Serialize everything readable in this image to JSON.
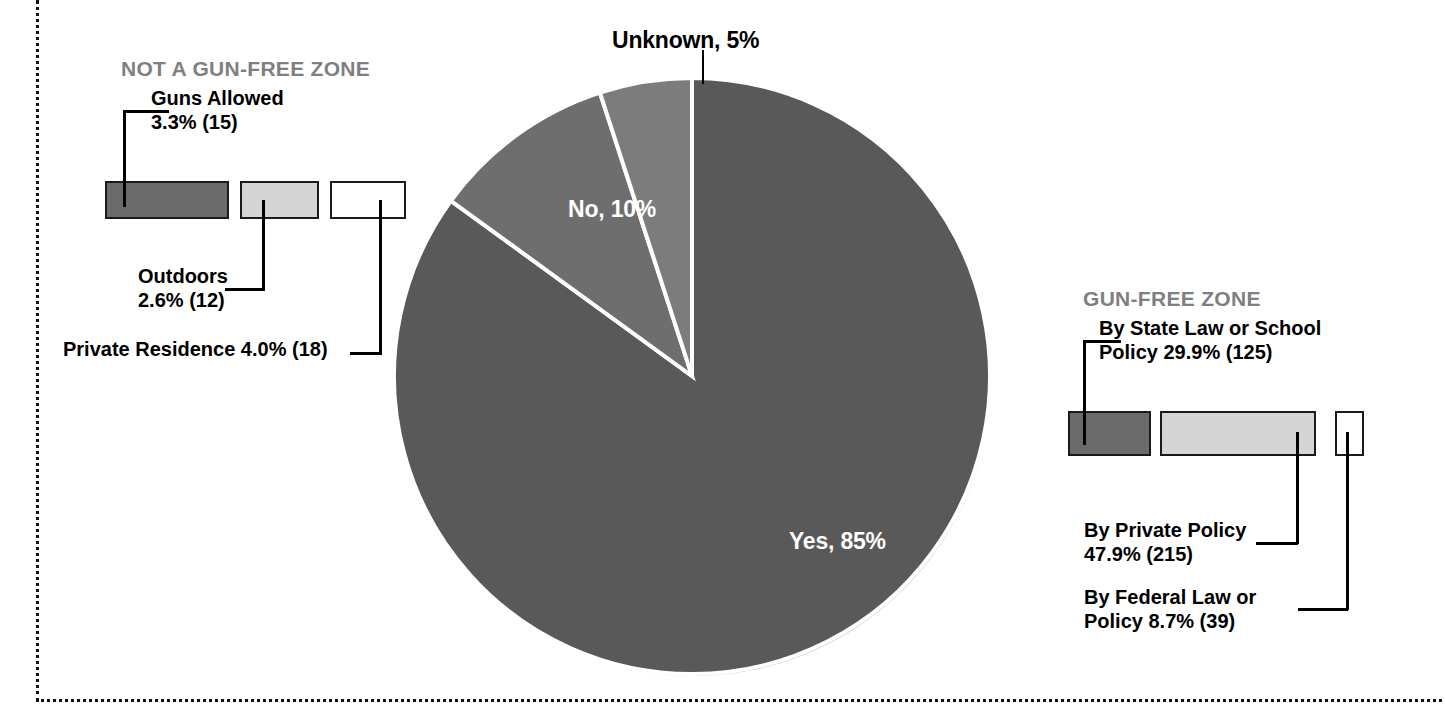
{
  "chart_data": {
    "type": "pie",
    "title": "",
    "categories": [
      "Yes",
      "No",
      "Unknown"
    ],
    "values": [
      85,
      10,
      5
    ],
    "labels": [
      "Yes, 85%",
      "No, 10%",
      "Unknown, 5%"
    ],
    "unit": "percent",
    "start_angle_deg": 0,
    "direction": "counterclockwise",
    "legend": "inside-slice-labels",
    "grid": false,
    "colors": {
      "Yes": "#595959",
      "No": "#6e6e6e",
      "Unknown": "#7c7c7c",
      "slice_border": "#ffffff"
    },
    "breakdowns": [
      {
        "heading": "NOT A GUN-FREE ZONE",
        "total_percent": 10,
        "items": [
          {
            "label": "Guns Allowed",
            "value_text": "3.3% (15)",
            "percent": 3.3,
            "count": 15,
            "swatch": "dark"
          },
          {
            "label": "Outdoors",
            "value_text": "2.6% (12)",
            "percent": 2.6,
            "count": 12,
            "swatch": "light"
          },
          {
            "label": "Private Residence",
            "value_text": "4.0% (18)",
            "percent": 4.0,
            "count": 18,
            "swatch": "white"
          }
        ]
      },
      {
        "heading": "GUN-FREE ZONE",
        "total_percent": 85,
        "items": [
          {
            "label": "By State Law or School Policy",
            "value_text": "29.9% (125)",
            "percent": 29.9,
            "count": 125,
            "swatch": "dark"
          },
          {
            "label": "By Private Policy",
            "value_text": "47.9% (215)",
            "percent": 47.9,
            "count": 215,
            "swatch": "light"
          },
          {
            "label": "By Federal Law or Policy",
            "value_text": "8.7% (39)",
            "percent": 8.7,
            "count": 39,
            "swatch": "white"
          }
        ]
      }
    ]
  },
  "pie": {
    "label_yes": "Yes, 85%",
    "label_no": "No, 10%",
    "label_unknown": "Unknown, 5%"
  },
  "left_group": {
    "heading": "NOT A GUN-FREE ZONE",
    "guns_allowed_line1": "Guns Allowed",
    "guns_allowed_line2": "3.3% (15)",
    "outdoors_line1": "Outdoors",
    "outdoors_line2": "2.6% (12)",
    "private_residence": "Private Residence 4.0% (18)"
  },
  "right_group": {
    "heading": "GUN-FREE ZONE",
    "state_law_line1": "By State Law or School",
    "state_law_line2": "Policy 29.9% (125)",
    "private_policy_line1": "By Private Policy",
    "private_policy_line2": "47.9% (215)",
    "federal_law_line1": "By Federal Law or",
    "federal_law_line2": "Policy 8.7% (39)"
  }
}
